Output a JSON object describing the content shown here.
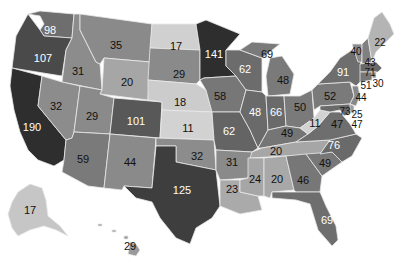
{
  "map": {
    "type": "choropleth",
    "region": "United States",
    "palette": {
      "very_light": "#cfcfcf",
      "light": "#a9a9a9",
      "mid": "#8c8c8c",
      "dark": "#6e6e6e",
      "darker": "#5a5a5a",
      "darkest": "#3a3a3a"
    },
    "states": [
      {
        "id": "WA",
        "value": "98"
      },
      {
        "id": "OR",
        "value": "107"
      },
      {
        "id": "CA",
        "value": "190"
      },
      {
        "id": "ID",
        "value": "31"
      },
      {
        "id": "NV",
        "value": "32"
      },
      {
        "id": "MT",
        "value": "35"
      },
      {
        "id": "WY",
        "value": "20"
      },
      {
        "id": "UT",
        "value": "29"
      },
      {
        "id": "AZ",
        "value": "59"
      },
      {
        "id": "CO",
        "value": "101"
      },
      {
        "id": "NM",
        "value": "44"
      },
      {
        "id": "ND",
        "value": "17"
      },
      {
        "id": "SD",
        "value": "29"
      },
      {
        "id": "NE",
        "value": "18"
      },
      {
        "id": "KS",
        "value": "11"
      },
      {
        "id": "OK",
        "value": "32"
      },
      {
        "id": "TX",
        "value": "125"
      },
      {
        "id": "MN",
        "value": "141"
      },
      {
        "id": "IA",
        "value": "58"
      },
      {
        "id": "MO",
        "value": "62"
      },
      {
        "id": "AR",
        "value": "31"
      },
      {
        "id": "LA",
        "value": "23"
      },
      {
        "id": "WI",
        "value": "62"
      },
      {
        "id": "IL",
        "value": "69"
      },
      {
        "id": "MI_UP",
        "value": "48"
      },
      {
        "id": "MI",
        "value": "48"
      },
      {
        "id": "IN",
        "value": "66"
      },
      {
        "id": "OH",
        "value": "50"
      },
      {
        "id": "KY",
        "value": "49"
      },
      {
        "id": "TN",
        "value": "20"
      },
      {
        "id": "MS",
        "value": "24"
      },
      {
        "id": "AL",
        "value": "20"
      },
      {
        "id": "GA",
        "value": "46"
      },
      {
        "id": "FL",
        "value": "69"
      },
      {
        "id": "SC",
        "value": "49"
      },
      {
        "id": "NC",
        "value": "76"
      },
      {
        "id": "VA",
        "value": "47"
      },
      {
        "id": "WV",
        "value": "11"
      },
      {
        "id": "PA",
        "value": "52"
      },
      {
        "id": "NY",
        "value": "91"
      },
      {
        "id": "VT",
        "value": "40"
      },
      {
        "id": "NH",
        "value": "43"
      },
      {
        "id": "ME",
        "value": "22"
      },
      {
        "id": "MA",
        "value": "71"
      },
      {
        "id": "RI",
        "value": "30"
      },
      {
        "id": "CT",
        "value": "51"
      },
      {
        "id": "NJ",
        "value": "44"
      },
      {
        "id": "MD",
        "value": "73"
      },
      {
        "id": "DE",
        "value": "25"
      },
      {
        "id": "DC",
        "value": "47"
      },
      {
        "id": "AK",
        "value": "17"
      },
      {
        "id": "HI",
        "value": "29"
      }
    ]
  }
}
